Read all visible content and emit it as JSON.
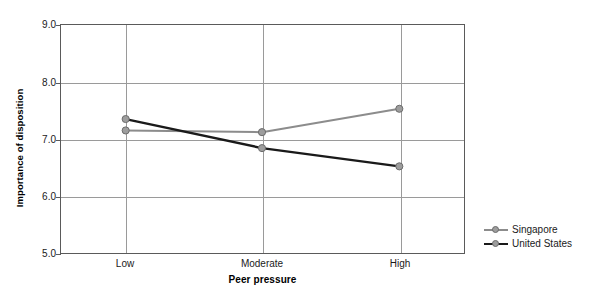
{
  "chart_data": {
    "type": "line",
    "title": "",
    "xlabel": "Peer pressure",
    "ylabel": "Importance of disposition",
    "categories": [
      "Low",
      "Moderate",
      "High"
    ],
    "ylim": [
      5.0,
      9.0
    ],
    "yticks": [
      "9.0",
      "8.0",
      "7.0",
      "6.0",
      "5.0"
    ],
    "ytick_values": [
      9.0,
      8.0,
      7.0,
      6.0,
      5.0
    ],
    "grid": true,
    "legend_position": "right",
    "series": [
      {
        "name": "Singapore",
        "color": "#8c8c8c",
        "marker": "circle",
        "values": [
          7.15,
          7.12,
          7.53
        ]
      },
      {
        "name": "United States",
        "color": "#1a1a1a",
        "marker": "circle",
        "values": [
          7.35,
          6.84,
          6.52
        ]
      }
    ]
  },
  "axes": {
    "y_tick_labels": [
      "9.0",
      "8.0",
      "7.0",
      "6.0",
      "5.0"
    ],
    "x_tick_labels": [
      "Low",
      "Moderate",
      "High"
    ],
    "y_title": "Importance of disposition",
    "x_title": "Peer pressure"
  },
  "legend": {
    "entries": [
      {
        "label": "Singapore",
        "color": "#8c8c8c"
      },
      {
        "label": "United States",
        "color": "#1a1a1a"
      }
    ]
  },
  "colors": {
    "singapore": "#8c8c8c",
    "united_states": "#1a1a1a",
    "grid": "#9a9a9a",
    "frame": "#5a5a5a",
    "marker_fill": "#9d9d9d",
    "marker_stroke": "#6b6b6b",
    "background": "#ffffff"
  }
}
